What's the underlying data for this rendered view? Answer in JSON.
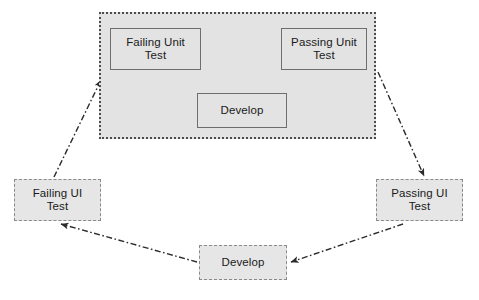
{
  "diagram": {
    "colors": {
      "node_fill": "#e3e3e3",
      "node_border_solid": "#6e6e6e",
      "node_border_dashed": "#8a8a8a",
      "container_border": "#4d4d4d",
      "arrow_solid": "#4a4a4a",
      "arrow_dashdot": "#2b2b2b",
      "text": "#1a1a1a",
      "background": "#ffffff"
    },
    "container": {
      "name": "unit-test-loop-container",
      "border_style": "dotted",
      "x": 99,
      "y": 12,
      "width": 277,
      "height": 127
    },
    "nodes": [
      {
        "id": "failing-unit-test",
        "label": "Failing Unit\nTest",
        "style": "solid",
        "x": 110,
        "y": 28,
        "width": 91,
        "height": 42
      },
      {
        "id": "passing-unit-test",
        "label": "Passing Unit\nTest",
        "style": "solid",
        "x": 281,
        "y": 28,
        "width": 86,
        "height": 42
      },
      {
        "id": "develop-unit",
        "label": "Develop",
        "style": "solid",
        "x": 197,
        "y": 93,
        "width": 90,
        "height": 35
      },
      {
        "id": "failing-ui-test",
        "label": "Failing UI\nTest",
        "style": "dashed",
        "x": 14,
        "y": 179,
        "width": 87,
        "height": 42
      },
      {
        "id": "passing-ui-test",
        "label": "Passing UI\nTest",
        "style": "dashed",
        "x": 376,
        "y": 179,
        "width": 87,
        "height": 42
      },
      {
        "id": "develop-ui",
        "label": "Develop",
        "style": "dashed",
        "x": 199,
        "y": 245,
        "width": 88,
        "height": 35
      }
    ],
    "edges": [
      {
        "id": "failing-unit-to-passing-unit",
        "from": "failing-unit-test",
        "to": "passing-unit-test",
        "style": "solid",
        "arrow": "end"
      },
      {
        "id": "passing-unit-to-develop",
        "from": "passing-unit-test",
        "to": "develop-unit",
        "style": "solid",
        "arrow": "end"
      },
      {
        "id": "develop-to-failing-unit",
        "from": "develop-unit",
        "to": "failing-unit-test",
        "style": "solid",
        "arrow": "end"
      },
      {
        "id": "failing-ui-to-unit-loop",
        "from": "failing-ui-test",
        "to": "unit-test-loop-container",
        "style": "dash-dot",
        "arrow": "end"
      },
      {
        "id": "unit-loop-to-passing-ui",
        "from": "unit-test-loop-container",
        "to": "passing-ui-test",
        "style": "dash-dot",
        "arrow": "end"
      },
      {
        "id": "passing-ui-to-develop-ui",
        "from": "passing-ui-test",
        "to": "develop-ui",
        "style": "dash-dot",
        "arrow": "end"
      },
      {
        "id": "develop-ui-to-failing-ui",
        "from": "develop-ui",
        "to": "failing-ui-test",
        "style": "dash-dot",
        "arrow": "end"
      }
    ]
  }
}
